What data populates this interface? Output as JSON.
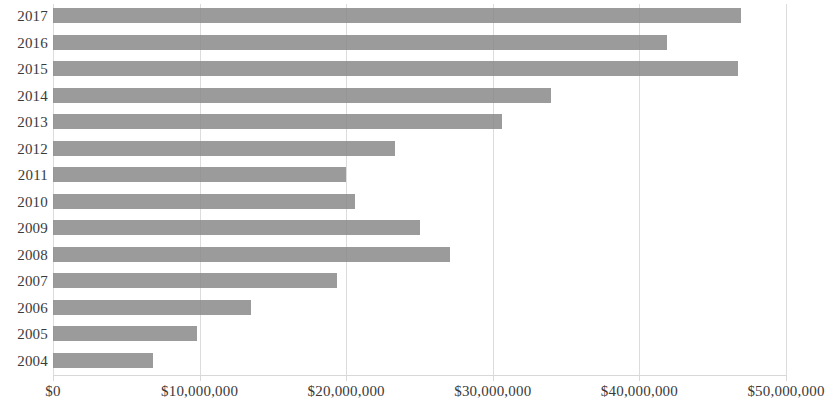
{
  "chart_data": {
    "type": "bar",
    "orientation": "horizontal",
    "title": "",
    "xlabel": "",
    "ylabel": "",
    "categories": [
      "2017",
      "2016",
      "2015",
      "2014",
      "2013",
      "2012",
      "2011",
      "2010",
      "2009",
      "2008",
      "2007",
      "2006",
      "2005",
      "2004"
    ],
    "values": [
      46900000,
      41900000,
      46700000,
      34000000,
      30600000,
      23300000,
      20000000,
      20600000,
      25000000,
      27100000,
      19400000,
      13500000,
      9800000,
      6800000
    ],
    "xlim": [
      0,
      50000000
    ],
    "xticks": [
      0,
      10000000,
      20000000,
      30000000,
      40000000,
      50000000
    ],
    "xtick_labels": [
      "$0",
      "$10,000,000",
      "$20,000,000",
      "$30,000,000",
      "$40,000,000",
      "$50,000,000"
    ],
    "grid": "vertical",
    "legend": "none",
    "bar_color": "#8b8b8b",
    "gridline_color": "#dcdcdc",
    "text_color": "#3a3a3a"
  }
}
